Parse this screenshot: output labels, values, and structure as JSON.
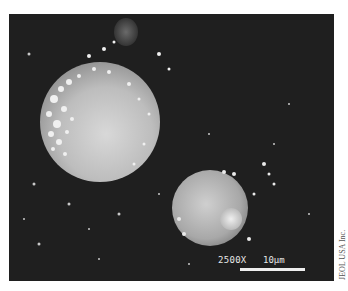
{
  "image": {
    "type": "SEM micrograph",
    "subject": "two spherical particles with surface debris on dark background"
  },
  "overlay": {
    "magnification": "2500X",
    "scale_bar_label": "10µm"
  },
  "credit": "JEOL USA Inc."
}
